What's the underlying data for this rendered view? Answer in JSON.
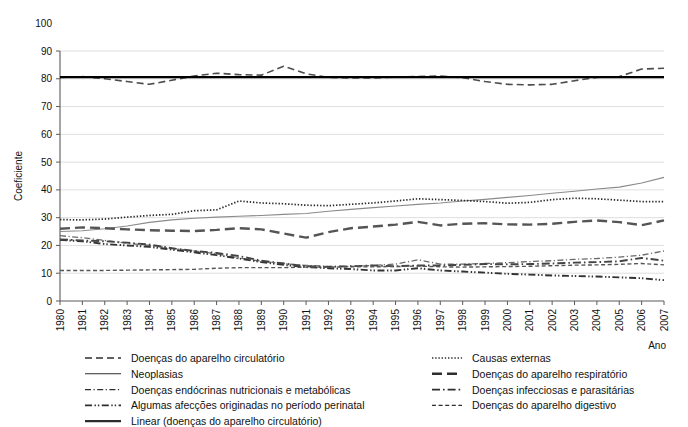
{
  "chart_data": {
    "type": "line",
    "title": "",
    "xlabel": "Ano",
    "ylabel": "Coeficiente",
    "xlim": [
      1980,
      2007
    ],
    "ylim": [
      0,
      100
    ],
    "yticks": [
      0,
      10,
      20,
      30,
      40,
      50,
      60,
      70,
      80,
      90,
      100
    ],
    "grid": true,
    "legend_position": "bottom",
    "x": [
      1980,
      1981,
      1982,
      1983,
      1984,
      1985,
      1986,
      1987,
      1988,
      1989,
      1990,
      1991,
      1992,
      1993,
      1994,
      1995,
      1996,
      1997,
      1998,
      1999,
      2000,
      2001,
      2002,
      2003,
      2004,
      2005,
      2006,
      2007
    ],
    "categories": [
      "1980",
      "1981",
      "1982",
      "1983",
      "1984",
      "1985",
      "1986",
      "1987",
      "1988",
      "1989",
      "1990",
      "1991",
      "1992",
      "1993",
      "1994",
      "1995",
      "1996",
      "1997",
      "1998",
      "1999",
      "2000",
      "2001",
      "2002",
      "2003",
      "2004",
      "2005",
      "2006",
      "2007"
    ],
    "series": [
      {
        "name": "Doenças do aparelho circulatório",
        "style": "dashed",
        "color": "#4d4d4d",
        "values": [
          80.5,
          80.8,
          80.0,
          79.0,
          78.0,
          79.5,
          81.0,
          82.0,
          81.5,
          81.3,
          84.5,
          81.8,
          80.5,
          80.3,
          80.3,
          80.6,
          80.8,
          81.0,
          80.4,
          79.0,
          78.0,
          77.8,
          78.0,
          79.3,
          80.5,
          80.8,
          83.5,
          83.8
        ]
      },
      {
        "name": "Neoplasias",
        "style": "solid-thin",
        "color": "#8a8a8a",
        "values": [
          25.0,
          25.3,
          26.0,
          27.0,
          28.3,
          29.2,
          29.8,
          30.2,
          30.5,
          30.8,
          31.2,
          31.5,
          32.3,
          33.0,
          33.6,
          34.2,
          34.8,
          35.3,
          36.0,
          36.6,
          37.3,
          38.0,
          38.8,
          39.5,
          40.3,
          41.0,
          42.5,
          44.5
        ]
      },
      {
        "name": "Doenças endócrinas nutricionais e metabólicas",
        "style": "dash-dot-fine",
        "color": "#6a6a6a",
        "values": [
          23.5,
          22.8,
          21.8,
          20.8,
          20.0,
          19.0,
          18.0,
          17.0,
          15.5,
          14.3,
          13.5,
          12.8,
          12.5,
          12.5,
          12.8,
          13.3,
          14.8,
          13.3,
          13.3,
          13.5,
          13.8,
          14.2,
          14.5,
          15.0,
          15.3,
          15.8,
          16.5,
          18.0
        ]
      },
      {
        "name": "Algumas afecções originadas no período perinatal",
        "style": "dash-dot-dot",
        "color": "#333333",
        "values": [
          22.0,
          21.5,
          20.5,
          20.0,
          19.5,
          18.5,
          17.5,
          16.5,
          15.3,
          14.0,
          13.0,
          12.2,
          11.8,
          11.5,
          11.0,
          11.0,
          11.8,
          11.0,
          10.6,
          10.2,
          9.8,
          9.5,
          9.2,
          9.0,
          8.8,
          8.5,
          8.2,
          7.5
        ]
      },
      {
        "name": "Linear (doenças do aparelho circulatório)",
        "style": "solid-thick",
        "color": "#000000",
        "values": [
          80.6,
          80.6,
          80.6,
          80.6,
          80.6,
          80.6,
          80.6,
          80.6,
          80.6,
          80.6,
          80.6,
          80.6,
          80.6,
          80.6,
          80.6,
          80.6,
          80.6,
          80.6,
          80.6,
          80.6,
          80.6,
          80.6,
          80.6,
          80.6,
          80.6,
          80.6,
          80.6,
          80.6
        ]
      },
      {
        "name": "Causas externas",
        "style": "dotted",
        "color": "#2b2b2b",
        "values": [
          29.3,
          29.2,
          29.5,
          30.2,
          30.8,
          31.2,
          32.5,
          32.8,
          36.0,
          35.3,
          35.0,
          34.5,
          34.3,
          34.8,
          35.3,
          36.0,
          36.8,
          36.5,
          36.2,
          35.8,
          35.2,
          35.5,
          36.5,
          37.0,
          36.8,
          36.3,
          35.8,
          35.8
        ]
      },
      {
        "name": "Doenças do aparelho respiratório",
        "style": "long-dash",
        "color": "#555555",
        "values": [
          26.0,
          26.5,
          26.2,
          25.8,
          25.5,
          25.3,
          25.2,
          25.6,
          26.2,
          25.8,
          24.3,
          22.8,
          24.8,
          26.2,
          26.8,
          27.5,
          28.5,
          27.2,
          27.8,
          28.0,
          27.6,
          27.5,
          27.8,
          28.5,
          29.0,
          28.4,
          27.3,
          29.0
        ]
      },
      {
        "name": "Doenças infecciosas e parasitárias",
        "style": "dash-dot",
        "color": "#444444",
        "values": [
          22.2,
          21.8,
          21.5,
          21.0,
          20.3,
          19.0,
          18.0,
          17.3,
          16.2,
          14.5,
          13.5,
          12.5,
          12.3,
          12.5,
          12.8,
          12.5,
          12.8,
          12.8,
          13.0,
          13.3,
          13.2,
          13.3,
          13.5,
          13.8,
          14.0,
          14.3,
          15.5,
          14.5
        ]
      },
      {
        "name": "Doenças do aparelho digestivo",
        "style": "short-dash",
        "color": "#555555",
        "values": [
          11.0,
          11.0,
          11.0,
          11.1,
          11.2,
          11.3,
          11.4,
          11.8,
          12.0,
          12.0,
          12.0,
          12.2,
          12.2,
          12.3,
          12.3,
          12.4,
          12.6,
          12.3,
          12.2,
          12.3,
          12.4,
          12.5,
          12.7,
          12.9,
          13.0,
          13.2,
          13.5,
          13.0
        ]
      }
    ]
  },
  "axes": {
    "y_label": "Coeficiente",
    "x_label": "Ano",
    "y_ticks": [
      "100",
      "90",
      "80",
      "70",
      "60",
      "50",
      "40",
      "30",
      "20",
      "10",
      "0"
    ],
    "x_ticks": [
      "1980",
      "1981",
      "1982",
      "1983",
      "1984",
      "1985",
      "1986",
      "1987",
      "1988",
      "1989",
      "1990",
      "1991",
      "1992",
      "1993",
      "1994",
      "1995",
      "1996",
      "1997",
      "1998",
      "1999",
      "2000",
      "2001",
      "2002",
      "2003",
      "2004",
      "2005",
      "2006",
      "2007"
    ]
  },
  "legend": {
    "column_left": [
      {
        "label": "Doenças do aparelho circulatório",
        "style": "dashed"
      },
      {
        "label": "Neoplasias",
        "style": "solid-thin"
      },
      {
        "label": "Doenças endócrinas nutricionais e metabólicas",
        "style": "dash-dot-fine"
      },
      {
        "label": "Algumas afecções originadas no período perinatal",
        "style": "dash-dot-dot"
      },
      {
        "label": "Linear (doenças do aparelho circulatório)",
        "style": "solid-thick"
      }
    ],
    "column_right": [
      {
        "label": "Causas externas",
        "style": "dotted"
      },
      {
        "label": "Doenças do aparelho respiratório",
        "style": "long-dash"
      },
      {
        "label": "Doenças infecciosas e parasitárias",
        "style": "dash-dot"
      },
      {
        "label": "Doenças do aparelho digestivo",
        "style": "short-dash"
      }
    ]
  }
}
